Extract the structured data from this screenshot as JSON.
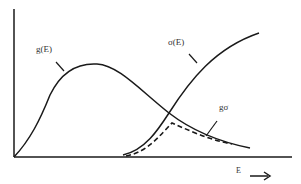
{
  "diagram": {
    "labels": {
      "g": "g(E)",
      "sigma": "σ(E)",
      "gsigma": "gσ",
      "xaxis": "E"
    },
    "arrow": "→",
    "colors": {
      "line": "#1a1a1a",
      "text": "#333333",
      "background": "#ffffff"
    },
    "curves": [
      {
        "name": "g(E)",
        "style": "solid",
        "description": "rises from origin, peaks mid-left, decays to right"
      },
      {
        "name": "σ(E)",
        "style": "solid",
        "description": "threshold onset then rises monotonically"
      },
      {
        "name": "gσ",
        "style": "dashed",
        "description": "product curve, peaks near crossing, decays"
      }
    ]
  }
}
